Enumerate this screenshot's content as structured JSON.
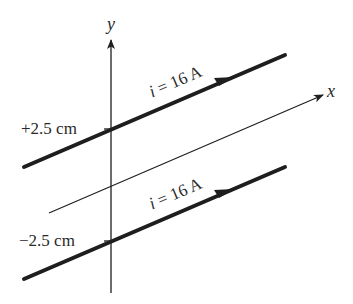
{
  "diagram": {
    "axes": {
      "x_label": "x",
      "y_label": "y"
    },
    "wires": [
      {
        "position_label": "+2.5 cm",
        "current_label": "i = 16 A",
        "current_var": "i",
        "current_value": "= 16 A"
      },
      {
        "position_label": "−2.5 cm",
        "current_label": "i = 16 A",
        "current_var": "i",
        "current_value": "= 16 A"
      }
    ],
    "colors": {
      "line": "#1e1e1e",
      "text": "#2a2a2a",
      "background": "#ffffff"
    }
  }
}
